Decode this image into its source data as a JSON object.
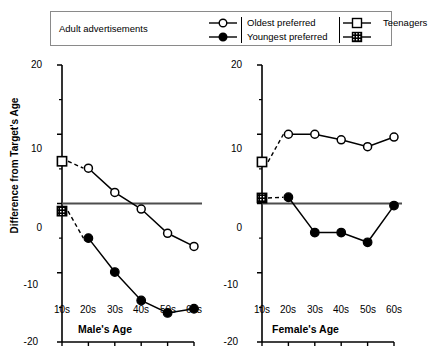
{
  "legend": {
    "title": "Adult advertisements",
    "groups": [
      {
        "name": "adult-series",
        "entries": [
          {
            "label": "Oldest preferred",
            "marker": "open-circle",
            "icon": "open-circle-marker-icon"
          },
          {
            "label": "Youngest preferred",
            "marker": "filled-circle",
            "icon": "filled-circle-marker-icon"
          }
        ]
      },
      {
        "name": "teenager-series",
        "entries": [
          {
            "label": "Teenagers",
            "marker": "open-square",
            "icon": "open-square-marker-icon"
          },
          {
            "label": "",
            "marker": "hatched-square",
            "icon": "hatched-square-marker-icon"
          }
        ]
      }
    ]
  },
  "colors": {
    "ink": "#000000",
    "axis": "#000000",
    "legend_border": "#8a8a8a",
    "zero_line": "#4d4d4d",
    "background": "#ffffff"
  },
  "chart_data": [
    {
      "type": "line",
      "id": "male-panel",
      "title": "",
      "xlabel": "Male's Age",
      "ylabel": "Difference from Target's Age",
      "categories": [
        "10s",
        "20s",
        "30s",
        "40s",
        "50s",
        "60s"
      ],
      "ylim": [
        -20,
        20
      ],
      "yticks": [
        -20,
        -10,
        0,
        10,
        20
      ],
      "yticklabels": [
        "-20",
        "-10",
        "0",
        "10",
        "20"
      ],
      "yminorticks": [
        -15,
        -5,
        5,
        15
      ],
      "grid": false,
      "zero_line": 0,
      "legend_position": "above-figure",
      "series": [
        {
          "name": "Oldest preferred",
          "marker": "open-circle",
          "x": [
            "20s",
            "30s",
            "40s",
            "50s",
            "60s"
          ],
          "values": [
            5.1,
            1.6,
            -0.8,
            -4.3,
            -6.2
          ]
        },
        {
          "name": "Youngest preferred",
          "marker": "filled-circle",
          "x": [
            "20s",
            "30s",
            "40s",
            "50s",
            "60s"
          ],
          "values": [
            -5.0,
            -9.9,
            -14.0,
            -15.8,
            -15.2
          ]
        },
        {
          "name": "Teenagers (oldest preferred)",
          "marker": "open-square",
          "x": [
            "10s"
          ],
          "values": [
            6.1
          ]
        },
        {
          "name": "Teenagers (youngest preferred)",
          "marker": "hatched-square",
          "x": [
            "10s"
          ],
          "values": [
            -1.1
          ]
        }
      ]
    },
    {
      "type": "line",
      "id": "female-panel",
      "title": "",
      "xlabel": "Female's Age",
      "ylabel": "",
      "categories": [
        "10s",
        "20s",
        "30s",
        "40s",
        "50s",
        "60s"
      ],
      "ylim": [
        -20,
        20
      ],
      "yticks": [
        -20,
        -10,
        0,
        10,
        20
      ],
      "yticklabels": [
        "-20",
        "-10",
        "0",
        "10",
        "20"
      ],
      "yminorticks": [
        -15,
        -5,
        5,
        15
      ],
      "grid": false,
      "zero_line": 0,
      "legend_position": "above-figure",
      "series": [
        {
          "name": "Oldest preferred",
          "marker": "open-circle",
          "x": [
            "20s",
            "30s",
            "40s",
            "50s",
            "60s"
          ],
          "values": [
            10.0,
            10.0,
            9.2,
            8.2,
            9.6
          ]
        },
        {
          "name": "Youngest preferred",
          "marker": "filled-circle",
          "x": [
            "20s",
            "30s",
            "40s",
            "50s",
            "60s"
          ],
          "values": [
            0.9,
            -4.2,
            -4.2,
            -5.6,
            -0.3
          ]
        },
        {
          "name": "Teenagers (oldest preferred)",
          "marker": "open-square",
          "x": [
            "10s"
          ],
          "values": [
            6.0
          ]
        },
        {
          "name": "Teenagers (youngest preferred)",
          "marker": "hatched-square",
          "x": [
            "10s"
          ],
          "values": [
            0.8
          ]
        }
      ]
    }
  ]
}
